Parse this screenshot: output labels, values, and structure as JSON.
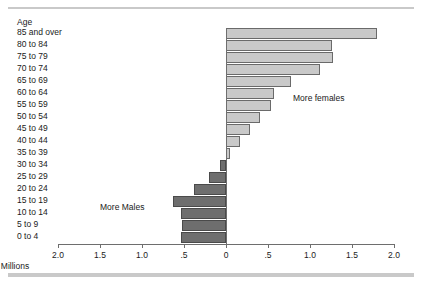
{
  "figure": {
    "axis_title": "Millions",
    "age_header": "Age"
  },
  "annotations": {
    "more_females": "More females",
    "more_males": "More Males"
  },
  "colors": {
    "female_fill": "#c9c9c9",
    "female_edge": "#6a6a6a",
    "male_fill": "#6e6e6e",
    "male_edge": "#4a4a4a",
    "axis": "#6e6e6e",
    "text": "#1a1a1a",
    "rule": "#c9c9c9",
    "background": "#ffffff"
  },
  "axis": {
    "tick_labels": [
      "2.0",
      "1.5",
      "1.0",
      ".5",
      "0",
      ".5",
      "1.0",
      "1.5",
      "2.0"
    ],
    "tick_values": [
      -2.0,
      -1.5,
      -1.0,
      -0.5,
      0,
      0.5,
      1.0,
      1.5,
      2.0
    ]
  },
  "chart_data": {
    "type": "bar",
    "title": "",
    "subtitle": "",
    "xlabel": "Millions",
    "ylabel": "Age",
    "orientation": "horizontal",
    "layout": "population-pyramid-diverging",
    "grid": false,
    "legend": "none",
    "xlim": [
      -2.0,
      2.0
    ],
    "xticks": [
      -2.0,
      -1.5,
      -1.0,
      -0.5,
      0.0,
      0.5,
      1.0,
      1.5,
      2.0
    ],
    "xticklabels": [
      "2.0",
      "1.5",
      "1.0",
      ".5",
      "0",
      ".5",
      "1.0",
      "1.5",
      "2.0"
    ],
    "note": "Positive values extend right (more females); negative values extend left (more males). Values are the net difference in millions.",
    "categories": [
      "85 and over",
      "80 to 84",
      "75 to 79",
      "70 to 74",
      "65 to 69",
      "60 to 64",
      "55 to 59",
      "50 to 54",
      "45 to 49",
      "40 to 44",
      "35 to 39",
      "30 to 34",
      "25 to 29",
      "20 to 24",
      "15 to 19",
      "10 to 14",
      "5 to 9",
      "0 to 4"
    ],
    "values": [
      1.8,
      1.26,
      1.27,
      1.12,
      0.77,
      0.57,
      0.53,
      0.4,
      0.28,
      0.17,
      0.05,
      -0.07,
      -0.2,
      -0.38,
      -0.63,
      -0.53,
      -0.52,
      -0.53
    ],
    "series": [
      {
        "name": "More females",
        "color": "#c9c9c9",
        "direction": "right"
      },
      {
        "name": "More Males",
        "color": "#6e6e6e",
        "direction": "left"
      }
    ],
    "annotations": [
      {
        "text": "More females",
        "x": 0.8,
        "y": "60 to 64"
      },
      {
        "text": "More Males",
        "x": -1.5,
        "y": "15 to 19"
      }
    ]
  }
}
